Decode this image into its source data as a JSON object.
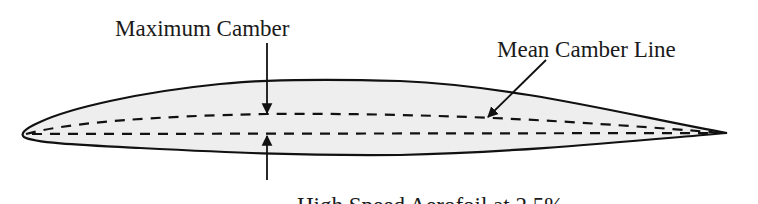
{
  "diagram": {
    "labels": {
      "maximum_camber": "Maximum Camber",
      "mean_camber_line": "Mean Camber Line",
      "caption": "High Speed Aerofoil at 2.5%"
    },
    "colors": {
      "background": "#ffffff",
      "airfoil_fill": "#eeeeef",
      "outline": "#111111",
      "text": "#1a1a1a"
    },
    "elements": [
      "airfoil-outline",
      "mean-camber-line (dashed)",
      "chord-line (dashed)",
      "maximum-camber arrows (top and bottom)",
      "mean-camber-line leader arrow"
    ]
  }
}
